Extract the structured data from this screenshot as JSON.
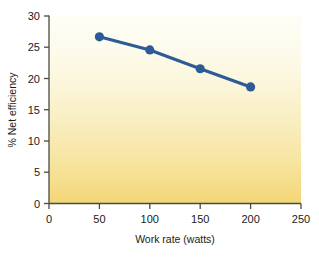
{
  "chart_data": {
    "type": "line",
    "title": "",
    "subtitle": "",
    "xlabel": "Work rate (watts)",
    "ylabel": "% Net efficiency",
    "xlim": [
      0,
      250
    ],
    "ylim": [
      0,
      30
    ],
    "xticks": [
      0,
      50,
      100,
      150,
      200,
      250
    ],
    "xtick_labels": [
      "0",
      "50",
      "100",
      "150",
      "200",
      "250"
    ],
    "yticks": [
      0,
      5,
      10,
      15,
      20,
      25,
      30
    ],
    "ytick_labels": [
      "0",
      "5",
      "10",
      "15",
      "20",
      "25",
      "30"
    ],
    "grid": false,
    "legend": false,
    "legend_position": "none",
    "x": [
      50,
      100,
      150,
      200
    ],
    "series": [
      {
        "name": "Net efficiency",
        "values": [
          26.6,
          24.5,
          21.5,
          18.6
        ],
        "color": "#2d5b96",
        "marker": "circle",
        "marker_size": 4.6,
        "line_width": 3.1
      }
    ],
    "annotations": []
  },
  "plot_area": {
    "background_gradient_top": "#fdfdf3",
    "background_gradient_bottom": "#f5d878",
    "axis_color": "#4a4a42",
    "text_color": "#1a1a1a"
  },
  "axis_titles": {
    "x": "Work rate (watts)",
    "y": "% Net efficiency"
  }
}
